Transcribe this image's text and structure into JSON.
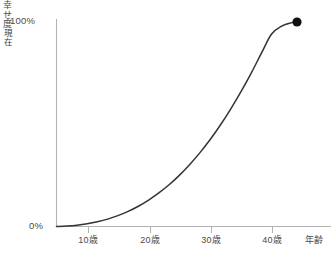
{
  "chart_data": {
    "type": "line",
    "title": "",
    "subtitle": "",
    "xlabel": "年齢",
    "ylabel": "幸せ度",
    "grid": false,
    "legend": false,
    "legend_position": "none",
    "xlim": [
      0,
      48
    ],
    "ylim": [
      0,
      100
    ],
    "x_tick_labels": [
      "10歳",
      "20歳",
      "30歳",
      "40歳"
    ],
    "x_tick_values": [
      10,
      20,
      30,
      40
    ],
    "y_tick_labels": [
      "0%",
      "100%"
    ],
    "y_tick_values": [
      0,
      100
    ],
    "series": [
      {
        "name": "幸せ度",
        "color": "#333333",
        "x": [
          0,
          2,
          4,
          6,
          8,
          10,
          12,
          14,
          16,
          18,
          20,
          22,
          24,
          26,
          28,
          30,
          32,
          34,
          36,
          38,
          40,
          42,
          44,
          46,
          47
        ],
        "values": [
          0,
          0.2,
          0.6,
          1.3,
          2.3,
          3.6,
          5.3,
          7.4,
          9.9,
          12.9,
          16.4,
          20.4,
          25.0,
          30.2,
          36.0,
          42.4,
          49.5,
          57.3,
          65.7,
          74.8,
          84.5,
          94.0,
          98.0,
          99.7,
          100
        ]
      }
    ],
    "annotations": [
      {
        "name": "現在",
        "text": "現在",
        "x": 47,
        "y": 100,
        "marker": "filled-circle",
        "marker_color": "#111111"
      }
    ],
    "colors": {
      "curve": "#333333",
      "axis": "#b3b3b3",
      "text": "#4a4a4a",
      "marker": "#111111",
      "background": "#ffffff"
    }
  },
  "axes": {
    "y_top_label": "100%",
    "y_bottom_label": "0%",
    "y_title": "幸せ度",
    "x_title": "年齢",
    "x_ticks": [
      {
        "label": "10歳",
        "px": 88
      },
      {
        "label": "20歳",
        "px": 150
      },
      {
        "label": "30歳",
        "px": 211
      },
      {
        "label": "40歳",
        "px": 272
      }
    ],
    "x_title_px": 314
  },
  "marker": {
    "label": "現在"
  }
}
